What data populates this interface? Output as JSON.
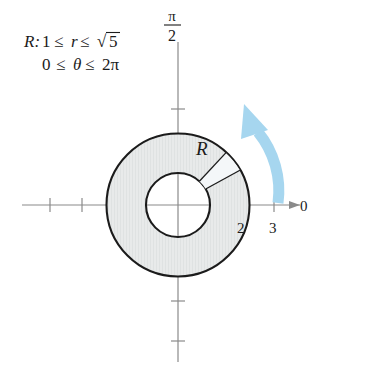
{
  "figure": {
    "name": "polar-annulus-region",
    "description_label": {
      "prefix": "R:",
      "line1_radial": "1 ≤ r ≤ √5",
      "line2_angular": "0 ≤ θ ≤ 2π",
      "line1_parts": {
        "lower": "1",
        "rel1": "≤",
        "var": "r",
        "rel2": "≤",
        "upper_radical": "√",
        "upper_value": "5"
      },
      "line2_parts": {
        "lower": "0",
        "rel1": "≤",
        "var": "θ",
        "rel2": "≤",
        "upper": "2π"
      }
    },
    "region_letter": "R",
    "axes": {
      "polar_axis_label": "0",
      "vertical_axis_label_numerator": "π",
      "vertical_axis_label_denominator": "2",
      "x_tick_labels": [
        "2",
        "3"
      ],
      "x_tick_values": [
        2,
        3
      ],
      "unlabeled_x_ticks": [
        -4,
        -3
      ],
      "unlabeled_y_ticks": [
        3,
        1,
        -1,
        -3
      ]
    },
    "geometry": {
      "center_x": 178,
      "center_y": 205,
      "unit_px": 32,
      "inner_radius_units": 1,
      "outer_radius_units": 2.236,
      "inner_radius_px": 32,
      "outer_radius_px": 71.5,
      "wedge_start_deg": 30,
      "wedge_end_deg": 48
    },
    "sweep_arrow": {
      "name": "counterclockwise-sweep-arrow",
      "direction": "counterclockwise",
      "start_deg": -4,
      "end_deg": 62
    },
    "colors": {
      "annulus_fill": "#e8eaea",
      "wedge_fill": "#f4f7f9",
      "ring_stroke": "#1b1b1b",
      "axis_stroke": "#8a8a8a",
      "arrow_blue": "#a6d6ef",
      "text": "#1b1b1b",
      "background": "#ffffff"
    }
  }
}
